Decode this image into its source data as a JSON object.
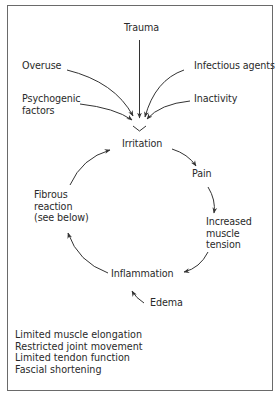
{
  "diagram": {
    "type": "flow-cycle",
    "causes": {
      "trauma": "Trauma",
      "overuse": "Overuse",
      "infectious_agents": "Infectious agents",
      "psychogenic_factors": "Psychogenic\nfactors",
      "inactivity": "Inactivity"
    },
    "cycle": {
      "irritation": "Irritation",
      "pain": "Pain",
      "increased_muscle_tension": "Increased\nmuscle\ntension",
      "inflammation": "Inflammation",
      "fibrous_reaction": "Fibrous\nreaction\n(see below)"
    },
    "side_input": {
      "edema": "Edema"
    },
    "outcomes": [
      "Limited muscle elongation",
      "Restricted joint movement",
      "Limited tendon function",
      "Fascial shortening"
    ],
    "colors": {
      "text": "#2a2a2a",
      "lines": "#333333",
      "border": "#6a6a6a"
    }
  }
}
